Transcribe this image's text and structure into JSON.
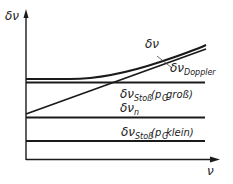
{
  "diagram": {
    "y_axis_label": "δν",
    "x_axis_label": "ν",
    "curves": [
      {
        "id": "total",
        "symbol": "δν",
        "subscript": "",
        "note": ""
      },
      {
        "id": "doppler",
        "symbol": "δν",
        "subscript": "Doppler",
        "note": ""
      },
      {
        "id": "stoss-gross",
        "symbol": "δν",
        "subscript": "Stoß",
        "note": "(p",
        "note_sub": "G",
        "note_rest": " groß)"
      },
      {
        "id": "natural",
        "symbol": "δν",
        "subscript": "n",
        "note": ""
      },
      {
        "id": "stoss-klein",
        "symbol": "δν",
        "subscript": "Stoß",
        "note": "(p",
        "note_sub": "G",
        "note_rest": " klein)"
      }
    ]
  }
}
